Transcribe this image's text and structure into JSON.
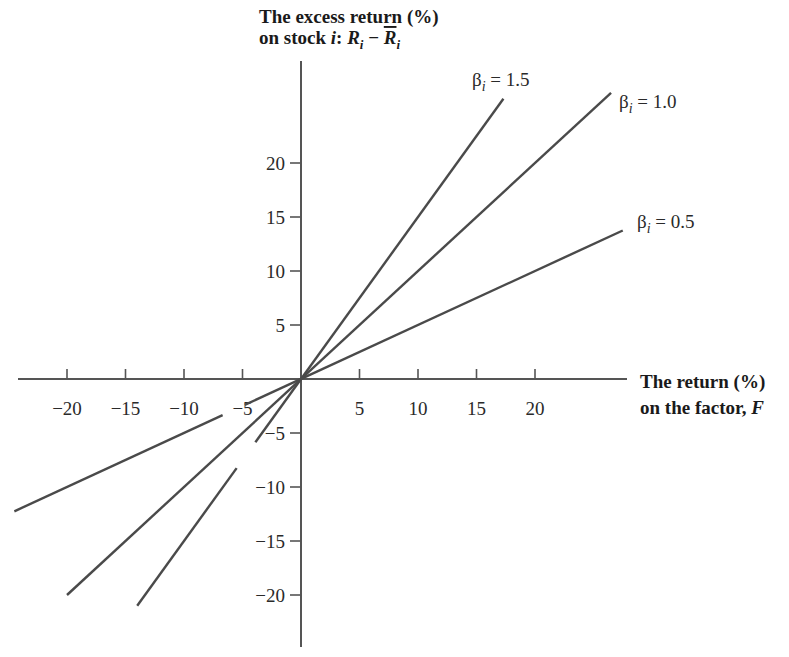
{
  "chart_data": {
    "type": "line",
    "title": "",
    "xlabel": "The return (%) on the factor, F",
    "ylabel": "The excess return (%) on stock i: R_i − R̄_i",
    "ylabel_lines": [
      "The excess return (%)",
      "on stock i: R",
      "i",
      " − R",
      "i"
    ],
    "xlabel_lines": [
      "The return (%)",
      "on the factor, ",
      "F"
    ],
    "xlim": [
      -25,
      27
    ],
    "ylim": [
      -24,
      27
    ],
    "grid": false,
    "legend": "inline labels at line ends",
    "x_ticks": [
      -20,
      -15,
      -10,
      -5,
      5,
      10,
      15,
      20
    ],
    "x_tick_labels": [
      "−20",
      "−15",
      "−10",
      "−5",
      "5",
      "10",
      "15",
      "20"
    ],
    "y_ticks": [
      20,
      15,
      10,
      5,
      -5,
      -10,
      -15,
      -20
    ],
    "y_tick_labels": [
      "20",
      "15",
      "10",
      "5",
      "−5",
      "−10",
      "−15",
      "−20"
    ],
    "series": [
      {
        "name": "β_i = 1.5",
        "label_beta": "β",
        "label_sub": "i",
        "label_value": " = 1.5",
        "slope": 1.5,
        "x": [
          -14,
          17.3
        ],
        "y": [
          -21,
          26
        ]
      },
      {
        "name": "β_i = 1.0",
        "label_beta": "β",
        "label_sub": "i",
        "label_value": " = 1.0",
        "slope": 1.0,
        "x": [
          -20,
          26.5
        ],
        "y": [
          -20,
          26.5
        ]
      },
      {
        "name": "β_i = 0.5",
        "label_beta": "β",
        "label_sub": "i",
        "label_value": " = 0.5",
        "slope": 0.5,
        "x": [
          -24.5,
          27.5
        ],
        "y": [
          -12.25,
          13.75
        ]
      }
    ]
  }
}
